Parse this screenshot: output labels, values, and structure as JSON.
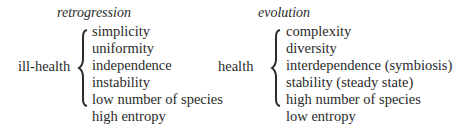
{
  "left": {
    "heading": "retrogression",
    "label": "ill-health",
    "items": [
      "simplicity",
      "uniformity",
      "independence",
      "instability",
      "low number of species",
      "high entropy"
    ]
  },
  "right": {
    "heading": "evolution",
    "label": "health",
    "items": [
      "complexity",
      "diversity",
      "interdependence (symbiosis)",
      "stability (steady state)",
      "high number of species",
      "low entropy"
    ]
  }
}
